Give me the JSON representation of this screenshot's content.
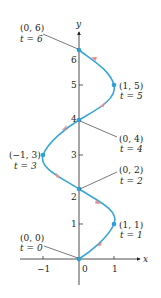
{
  "figure": {
    "axis_labels": {
      "x": "x",
      "y": "y"
    },
    "x_ticks": [
      {
        "value": -1,
        "label": "−1"
      },
      {
        "value": 0,
        "label": "0"
      },
      {
        "value": 1,
        "label": "1"
      }
    ],
    "y_ticks": [
      {
        "value": 1,
        "label": "1"
      },
      {
        "value": 2,
        "label": "2"
      },
      {
        "value": 3,
        "label": "3"
      },
      {
        "value": 4,
        "label": "4"
      },
      {
        "value": 5,
        "label": "5"
      },
      {
        "value": 6,
        "label": "6"
      }
    ],
    "points": [
      {
        "coord": "(0, 0)",
        "t": "t = 0"
      },
      {
        "coord": "(1, 1)",
        "t": "t = 1"
      },
      {
        "coord": "(0, 2)",
        "t": "t = 2"
      },
      {
        "coord": "(−1, 3)",
        "t": "t = 3"
      },
      {
        "coord": "(0, 4)",
        "t": "t = 4"
      },
      {
        "coord": "(1, 5)",
        "t": "t = 5"
      },
      {
        "coord": "(0, 6)",
        "t": "t = 6"
      }
    ],
    "colors": {
      "curve": "#3aa6d8",
      "point": "#2f9fd6",
      "arrow": "#f08a8a",
      "axis": "#231f20",
      "leader": "#231f20"
    }
  }
}
